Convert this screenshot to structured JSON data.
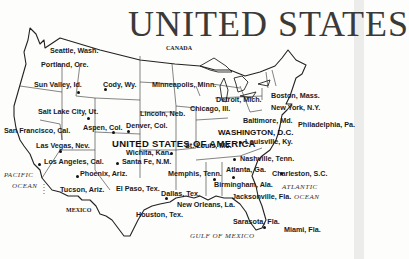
{
  "title": "UNITED STATES",
  "country_label": "UNITED STATES OF AMERICA",
  "capital": "WASHINGTON, D.C.",
  "neighbors": {
    "north": "CANADA",
    "south": "MEXICO"
  },
  "water_bodies": {
    "pacific_line1": "PACIFIC",
    "pacific_line2": "OCEAN",
    "atlantic_line1": "ATLANTIC",
    "atlantic_line2": "OCEAN",
    "gulf": "GULF OF MEXICO"
  },
  "cities": [
    {
      "name": "Seattle, Wash."
    },
    {
      "name": "Portland, Ore."
    },
    {
      "name": "Sun Valley, Id."
    },
    {
      "name": "Cody, Wy."
    },
    {
      "name": "Minneapolis, Minn."
    },
    {
      "name": "Salt Lake City, Ut."
    },
    {
      "name": "Lincoln, Neb."
    },
    {
      "name": "Chicago, Ill."
    },
    {
      "name": "Detroit, Mich."
    },
    {
      "name": "Boston, Mass."
    },
    {
      "name": "New York, N.Y."
    },
    {
      "name": "Baltimore, Md."
    },
    {
      "name": "Philadelphia, Pa."
    },
    {
      "name": "San Francisco, Cal."
    },
    {
      "name": "Aspen, Col."
    },
    {
      "name": "Denver, Col."
    },
    {
      "name": "Las Vegas, Nev."
    },
    {
      "name": "Wichita, Kan."
    },
    {
      "name": "St. Louis, Mo."
    },
    {
      "name": "Louisville, Ky."
    },
    {
      "name": "Los Angeles, Cal."
    },
    {
      "name": "Santa Fe, N.M."
    },
    {
      "name": "Nashville, Tenn."
    },
    {
      "name": "Phoenix, Ariz."
    },
    {
      "name": "Memphis, Tenn."
    },
    {
      "name": "Atlanta, Ga."
    },
    {
      "name": "Charleston, S.C."
    },
    {
      "name": "Tucson, Ariz."
    },
    {
      "name": "El Paso, Tex."
    },
    {
      "name": "Dallas, Tex."
    },
    {
      "name": "Birmingham, Ala."
    },
    {
      "name": "Jacksonville, Fla."
    },
    {
      "name": "New Orleans, La."
    },
    {
      "name": "Houston, Tex."
    },
    {
      "name": "Sarasota, Fla."
    },
    {
      "name": "Miami, Fla."
    }
  ]
}
